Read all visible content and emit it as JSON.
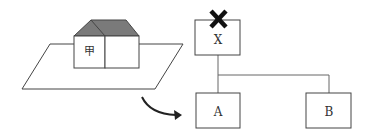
{
  "diagram": {
    "house": {
      "label": "甲",
      "roof_color": "#777777",
      "line_color": "#333333"
    },
    "arrow": {
      "direction": "curved-right",
      "color": "#222222"
    },
    "tree": {
      "root": {
        "label": "X",
        "marked": true,
        "mark": "✖"
      },
      "children": [
        {
          "label": "A"
        },
        {
          "label": "B"
        }
      ],
      "line_color": "#555555"
    }
  }
}
